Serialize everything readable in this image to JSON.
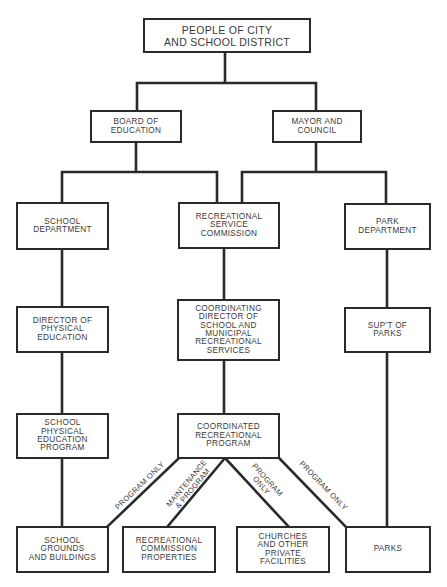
{
  "colors": {
    "line": "#2a2a2a",
    "text": "#3a3a3a",
    "background": "#ffffff"
  },
  "nodes": {
    "people": {
      "label": "PEOPLE OF CITY\nAND SCHOOL DISTRICT"
    },
    "board": {
      "label": "BOARD OF\nEDUCATION"
    },
    "mayor": {
      "label": "MAYOR AND\nCOUNCIL"
    },
    "school_dept": {
      "label": "SCHOOL\nDEPARTMENT"
    },
    "rec_service": {
      "label": "RECREATIONAL\nSERVICE\nCOMMISSION"
    },
    "park_dept": {
      "label": "PARK\nDEPARTMENT"
    },
    "director_pe": {
      "label": "DIRECTOR OF\nPHYSICAL\nEDUCATION"
    },
    "coord_director": {
      "label": "COORDINATING\nDIRECTOR OF\nSCHOOL AND\nMUNICIPAL\nRECREATIONAL\nSERVICES"
    },
    "supt_parks": {
      "label": "SUP'T OF\nPARKS"
    },
    "school_pe_program": {
      "label": "SCHOOL\nPHYSICAL\nEDUCATION\nPROGRAM"
    },
    "coord_program": {
      "label": "COORDINATED\nRECREATIONAL\nPROGRAM"
    },
    "school_grounds": {
      "label": "SCHOOL\nGROUNDS\nAND BUILDINGS"
    },
    "rec_properties": {
      "label": "RECREATIONAL\nCOMMISSION\nPROPERTIES"
    },
    "churches": {
      "label": "CHURCHES\nAND OTHER\nPRIVATE\nFACILITIES"
    },
    "parks": {
      "label": "PARKS"
    }
  },
  "edge_labels": {
    "to_school_grounds": "PROGRAM ONLY",
    "to_rec_properties": "MAINTENANCE\n& PROGRAM",
    "to_churches": "PROGRAM\nONLY",
    "to_parks": "PROGRAM ONLY"
  }
}
